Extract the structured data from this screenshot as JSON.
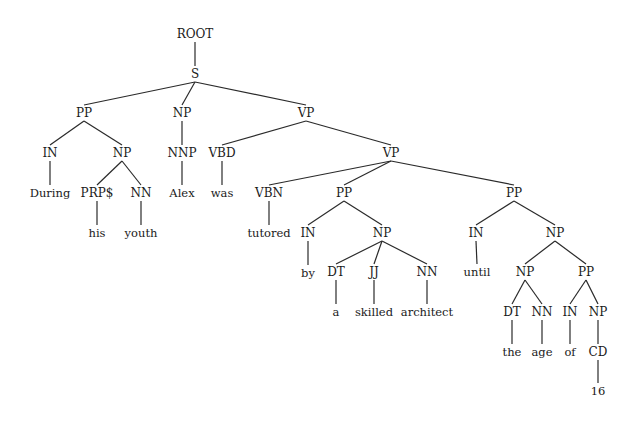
{
  "diagram": {
    "type": "constituency-parse-tree",
    "sentence": "During his youth Alex was tutored by a skilled architect until the age of 16",
    "nodes": [
      {
        "id": "n0",
        "label": "ROOT",
        "kind": "phrase",
        "x": 195,
        "y": 34,
        "parent": null
      },
      {
        "id": "n1",
        "label": "S",
        "kind": "phrase",
        "x": 195,
        "y": 74,
        "parent": "n0"
      },
      {
        "id": "n2",
        "label": "PP",
        "kind": "phrase",
        "x": 84,
        "y": 113,
        "parent": "n1"
      },
      {
        "id": "n3",
        "label": "NP",
        "kind": "phrase",
        "x": 182,
        "y": 113,
        "parent": "n1"
      },
      {
        "id": "n4",
        "label": "VP",
        "kind": "phrase",
        "x": 306,
        "y": 113,
        "parent": "n1"
      },
      {
        "id": "n5",
        "label": "IN",
        "kind": "pos",
        "x": 50,
        "y": 153,
        "parent": "n2"
      },
      {
        "id": "n6",
        "label": "NP",
        "kind": "phrase",
        "x": 122,
        "y": 153,
        "parent": "n2"
      },
      {
        "id": "n7",
        "label": "NNP",
        "kind": "pos",
        "x": 182,
        "y": 153,
        "parent": "n3"
      },
      {
        "id": "n8",
        "label": "VBD",
        "kind": "pos",
        "x": 222,
        "y": 153,
        "parent": "n4"
      },
      {
        "id": "n9",
        "label": "VP",
        "kind": "phrase",
        "x": 391,
        "y": 153,
        "parent": "n4"
      },
      {
        "id": "n10",
        "label": "During",
        "kind": "word",
        "x": 50,
        "y": 193,
        "parent": "n5"
      },
      {
        "id": "n11",
        "label": "PRP$",
        "kind": "pos",
        "x": 97,
        "y": 193,
        "parent": "n6"
      },
      {
        "id": "n12",
        "label": "NN",
        "kind": "pos",
        "x": 141,
        "y": 193,
        "parent": "n6"
      },
      {
        "id": "n13",
        "label": "Alex",
        "kind": "word",
        "x": 182,
        "y": 193,
        "parent": "n7"
      },
      {
        "id": "n14",
        "label": "was",
        "kind": "word",
        "x": 222,
        "y": 193,
        "parent": "n8"
      },
      {
        "id": "n15",
        "label": "VBN",
        "kind": "pos",
        "x": 269,
        "y": 193,
        "parent": "n9"
      },
      {
        "id": "n16",
        "label": "PP",
        "kind": "phrase",
        "x": 344,
        "y": 193,
        "parent": "n9"
      },
      {
        "id": "n17",
        "label": "PP",
        "kind": "phrase",
        "x": 514,
        "y": 193,
        "parent": "n9"
      },
      {
        "id": "n18",
        "label": "his",
        "kind": "word",
        "x": 97,
        "y": 233,
        "parent": "n11"
      },
      {
        "id": "n19",
        "label": "youth",
        "kind": "word",
        "x": 141,
        "y": 233,
        "parent": "n12"
      },
      {
        "id": "n20",
        "label": "tutored",
        "kind": "word",
        "x": 269,
        "y": 233,
        "parent": "n15"
      },
      {
        "id": "n21",
        "label": "IN",
        "kind": "pos",
        "x": 308,
        "y": 233,
        "parent": "n16"
      },
      {
        "id": "n22",
        "label": "NP",
        "kind": "phrase",
        "x": 382,
        "y": 233,
        "parent": "n16"
      },
      {
        "id": "n23",
        "label": "IN",
        "kind": "pos",
        "x": 476,
        "y": 233,
        "parent": "n17"
      },
      {
        "id": "n24",
        "label": "NP",
        "kind": "phrase",
        "x": 555,
        "y": 233,
        "parent": "n17"
      },
      {
        "id": "n25",
        "label": "by",
        "kind": "word",
        "x": 308,
        "y": 273,
        "parent": "n21"
      },
      {
        "id": "n26",
        "label": "DT",
        "kind": "pos",
        "x": 336,
        "y": 272,
        "parent": "n22"
      },
      {
        "id": "n27",
        "label": "JJ",
        "kind": "pos",
        "x": 374,
        "y": 272,
        "parent": "n22"
      },
      {
        "id": "n28",
        "label": "NN",
        "kind": "pos",
        "x": 427,
        "y": 272,
        "parent": "n22"
      },
      {
        "id": "n29",
        "label": "until",
        "kind": "word",
        "x": 477,
        "y": 272,
        "parent": "n23"
      },
      {
        "id": "n30",
        "label": "NP",
        "kind": "phrase",
        "x": 525,
        "y": 272,
        "parent": "n24"
      },
      {
        "id": "n31",
        "label": "PP",
        "kind": "phrase",
        "x": 586,
        "y": 272,
        "parent": "n24"
      },
      {
        "id": "n32",
        "label": "a",
        "kind": "word",
        "x": 336,
        "y": 312,
        "parent": "n26"
      },
      {
        "id": "n33",
        "label": "skilled",
        "kind": "word",
        "x": 374,
        "y": 312,
        "parent": "n27"
      },
      {
        "id": "n34",
        "label": "architect",
        "kind": "word",
        "x": 427,
        "y": 312,
        "parent": "n28"
      },
      {
        "id": "n35",
        "label": "DT",
        "kind": "pos",
        "x": 512,
        "y": 312,
        "parent": "n30"
      },
      {
        "id": "n36",
        "label": "NN",
        "kind": "pos",
        "x": 542,
        "y": 312,
        "parent": "n30"
      },
      {
        "id": "n37",
        "label": "IN",
        "kind": "pos",
        "x": 570,
        "y": 312,
        "parent": "n31"
      },
      {
        "id": "n38",
        "label": "NP",
        "kind": "phrase",
        "x": 598,
        "y": 312,
        "parent": "n31"
      },
      {
        "id": "n39",
        "label": "the",
        "kind": "word",
        "x": 512,
        "y": 352,
        "parent": "n35"
      },
      {
        "id": "n40",
        "label": "age",
        "kind": "word",
        "x": 542,
        "y": 352,
        "parent": "n36"
      },
      {
        "id": "n41",
        "label": "of",
        "kind": "word",
        "x": 570,
        "y": 352,
        "parent": "n37"
      },
      {
        "id": "n42",
        "label": "CD",
        "kind": "pos",
        "x": 598,
        "y": 352,
        "parent": "n38"
      },
      {
        "id": "n43",
        "label": "16",
        "kind": "word",
        "x": 598,
        "y": 391,
        "parent": "n42"
      }
    ],
    "colors": {
      "background": "#ffffff",
      "text": "#1a1a1a",
      "edge": "#2a2a2a"
    }
  }
}
